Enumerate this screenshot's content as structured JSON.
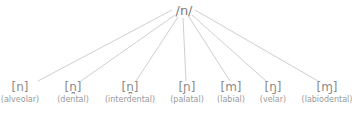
{
  "root": {
    "label": "/n/"
  },
  "allophones": [
    {
      "symbol": "[n]",
      "label": "(alveolar)"
    },
    {
      "symbol": "[n̪]",
      "label": "(dental)"
    },
    {
      "symbol": "[n̪]",
      "label": "(interdental)"
    },
    {
      "symbol": "[ɲ]",
      "label": "(palatal)"
    },
    {
      "symbol": "[m]",
      "label": "(labial)"
    },
    {
      "symbol": "[ŋ]",
      "label": "(velar)"
    },
    {
      "symbol": "[ɱ]",
      "label": "(labiodental)"
    }
  ]
}
